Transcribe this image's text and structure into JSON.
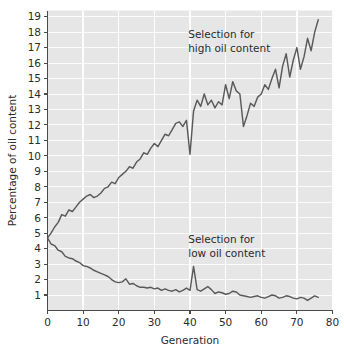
{
  "chart_data": {
    "type": "line",
    "title": "",
    "xlabel": "Generation",
    "ylabel": "Percentage of oil content",
    "xlim": [
      0,
      80
    ],
    "ylim": [
      0,
      19.4
    ],
    "grid": true,
    "legend_position": "inline-annotation",
    "x_ticks": [
      0,
      10,
      20,
      30,
      40,
      50,
      60,
      70,
      80
    ],
    "x_tick_labels": [
      "0",
      "10",
      "20",
      "30",
      "40",
      "50",
      "60",
      "70",
      "80"
    ],
    "y_ticks": [
      1,
      2,
      3,
      4,
      5,
      6,
      7,
      8,
      9,
      10,
      11,
      12,
      13,
      14,
      15,
      16,
      17,
      18,
      19
    ],
    "y_tick_labels": [
      "1",
      "2",
      "3",
      "4",
      "5",
      "6",
      "7",
      "8",
      "9",
      "10",
      "11",
      "12",
      "13",
      "14",
      "15",
      "16",
      "17",
      "18",
      "19"
    ],
    "series": [
      {
        "name": "Selection for high oil content",
        "color": "#5a5a5a",
        "annotation_line1": "Selection for",
        "annotation_line2": "high oil content",
        "annotation_x": 39.5,
        "annotation_y": 17.6,
        "x": [
          0,
          1,
          2,
          3,
          4,
          5,
          6,
          7,
          8,
          9,
          10,
          11,
          12,
          13,
          14,
          15,
          16,
          17,
          18,
          19,
          20,
          21,
          22,
          23,
          24,
          25,
          26,
          27,
          28,
          29,
          30,
          31,
          32,
          33,
          34,
          35,
          36,
          37,
          38,
          39,
          40,
          41,
          42,
          43,
          44,
          45,
          46,
          47,
          48,
          49,
          50,
          51,
          52,
          53,
          54,
          55,
          56,
          57,
          58,
          59,
          60,
          61,
          62,
          63,
          64,
          65,
          66,
          67,
          68,
          69,
          70,
          71,
          72,
          73,
          74,
          75,
          76
        ],
        "y": [
          4.7,
          5.0,
          5.4,
          5.7,
          6.2,
          6.1,
          6.5,
          6.4,
          6.7,
          7.0,
          7.2,
          7.4,
          7.5,
          7.3,
          7.4,
          7.6,
          7.9,
          8.0,
          8.3,
          8.2,
          8.6,
          8.8,
          9.0,
          9.3,
          9.2,
          9.6,
          9.8,
          10.2,
          10.1,
          10.5,
          10.8,
          10.6,
          11.0,
          11.4,
          11.3,
          11.7,
          12.1,
          12.2,
          11.9,
          12.3,
          10.1,
          12.9,
          13.6,
          13.2,
          14.0,
          13.3,
          13.6,
          13.1,
          13.5,
          13.3,
          14.6,
          13.7,
          14.8,
          14.2,
          14.0,
          11.9,
          12.6,
          13.4,
          13.2,
          13.8,
          14.0,
          14.6,
          14.3,
          15.0,
          15.6,
          14.4,
          15.8,
          16.6,
          15.1,
          16.2,
          17.0,
          15.6,
          16.4,
          17.6,
          16.8,
          18.0,
          18.8
        ]
      },
      {
        "name": "Selection for low oil content",
        "color": "#5a5a5a",
        "annotation_line1": "Selection for",
        "annotation_line2": "low oil content",
        "annotation_x": 39.5,
        "annotation_y": 4.35,
        "x": [
          0,
          1,
          2,
          3,
          4,
          5,
          6,
          7,
          8,
          9,
          10,
          11,
          12,
          13,
          14,
          15,
          16,
          17,
          18,
          19,
          20,
          21,
          22,
          23,
          24,
          25,
          26,
          27,
          28,
          29,
          30,
          31,
          32,
          33,
          34,
          35,
          36,
          37,
          38,
          39,
          40,
          41,
          42,
          43,
          44,
          45,
          46,
          47,
          48,
          49,
          50,
          51,
          52,
          53,
          54,
          55,
          56,
          57,
          58,
          59,
          60,
          61,
          62,
          63,
          64,
          65,
          66,
          67,
          68,
          69,
          70,
          71,
          72,
          73,
          74,
          75,
          76
        ],
        "y": [
          4.7,
          4.3,
          4.2,
          3.9,
          3.8,
          3.5,
          3.4,
          3.35,
          3.2,
          3.1,
          2.9,
          2.85,
          2.75,
          2.6,
          2.5,
          2.4,
          2.3,
          2.2,
          2.0,
          1.85,
          1.8,
          1.85,
          2.05,
          1.7,
          1.75,
          1.6,
          1.5,
          1.5,
          1.45,
          1.5,
          1.4,
          1.45,
          1.3,
          1.4,
          1.3,
          1.25,
          1.35,
          1.2,
          1.3,
          1.45,
          1.3,
          2.85,
          1.35,
          1.25,
          1.4,
          1.55,
          1.35,
          1.1,
          1.2,
          1.15,
          1.05,
          1.1,
          1.25,
          1.2,
          1.0,
          0.95,
          0.9,
          0.85,
          0.9,
          0.95,
          0.85,
          0.8,
          0.9,
          1.0,
          0.95,
          0.8,
          0.85,
          0.95,
          0.9,
          0.8,
          0.75,
          0.85,
          0.8,
          0.65,
          0.8,
          0.95,
          0.85
        ]
      }
    ]
  },
  "colors": {
    "plot_background": "#e6e6e6",
    "gridline": "#fbfbfb",
    "line": "#5a5a5a",
    "axis": "#4a4a4a",
    "text": "#2b2b2b",
    "page_background": "#ffffff"
  }
}
